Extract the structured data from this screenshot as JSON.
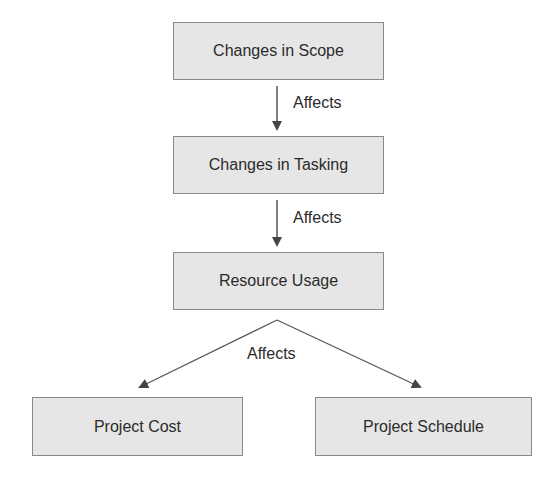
{
  "diagram": {
    "nodes": [
      {
        "id": "scope",
        "label": "Changes in Scope"
      },
      {
        "id": "tasking",
        "label": "Changes in Tasking"
      },
      {
        "id": "resource",
        "label": "Resource Usage"
      },
      {
        "id": "cost",
        "label": "Project Cost"
      },
      {
        "id": "schedule",
        "label": "Project Schedule"
      }
    ],
    "edges": [
      {
        "from": "scope",
        "to": "tasking",
        "label": "Affects"
      },
      {
        "from": "tasking",
        "to": "resource",
        "label": "Affects"
      },
      {
        "from": "resource",
        "to": "cost",
        "label": "Affects"
      },
      {
        "from": "resource",
        "to": "schedule",
        "label": "Affects"
      }
    ],
    "edge_labels": [
      "Affects",
      "Affects",
      "Affects"
    ]
  },
  "colors": {
    "node_fill": "#e6e6e6",
    "node_border": "#8a8a8a",
    "text": "#2b2b2b",
    "arrow": "#444444"
  }
}
